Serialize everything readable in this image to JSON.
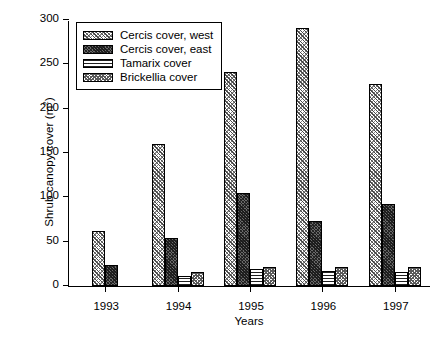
{
  "chart_data": {
    "type": "bar",
    "title": "",
    "xlabel": "Years",
    "ylabel": "Shrub canopy cover (m²)",
    "categories": [
      "1993",
      "1994",
      "1995",
      "1996",
      "1997"
    ],
    "ylim": [
      0,
      300
    ],
    "yticks": [
      0,
      50,
      100,
      150,
      200,
      250,
      300
    ],
    "grid": false,
    "legend_position": "top-left inside",
    "series": [
      {
        "name": "Cercis cover, west",
        "pattern": "diagonal-crosshatch-light",
        "values": [
          62,
          160,
          241,
          291,
          228
        ]
      },
      {
        "name": "Cercis cover, east",
        "pattern": "dense-dark-crosshatch",
        "values": [
          24,
          54,
          105,
          73,
          92
        ]
      },
      {
        "name": "Tamarix cover",
        "pattern": "horizontal-lines",
        "values": [
          0,
          11,
          19,
          17,
          16
        ]
      },
      {
        "name": "Brickellia cover",
        "pattern": "dotted-crosshatch",
        "values": [
          0,
          16,
          21,
          21,
          22
        ]
      }
    ]
  },
  "axes": {
    "y_tick_labels": [
      "0",
      "50",
      "100",
      "150",
      "200",
      "250",
      "300"
    ],
    "x_tick_labels": [
      "1993",
      "1994",
      "1995",
      "1996",
      "1997"
    ],
    "y_axis_title": "Shrub canopy cover (m",
    "y_axis_title_sup": "2",
    "y_axis_title_end": ")",
    "x_axis_title": "Years"
  },
  "legend": {
    "items": [
      {
        "label": "Cercis cover, west"
      },
      {
        "label": "Cercis cover, east"
      },
      {
        "label": "Tamarix cover"
      },
      {
        "label": "Brickellia cover"
      }
    ]
  }
}
